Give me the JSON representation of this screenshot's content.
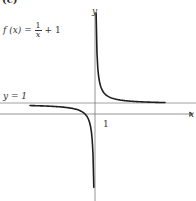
{
  "figure": {
    "panel_label": "(c)",
    "function_label": {
      "lhs": "f (x) =",
      "numerator": "1",
      "denominator": "x",
      "tail": "+ 1"
    },
    "asymptote_label": "y = 1",
    "axis_labels": {
      "x": "x",
      "y": "y"
    },
    "tick_labels": {
      "x_one": "1"
    },
    "colors": {
      "axis": "#7a7a7a",
      "curve": "#1e1e1e",
      "asymptote": "#8a8a8a",
      "text": "#333333"
    }
  },
  "chart_data": {
    "type": "line",
    "xlabel": "x",
    "ylabel": "y",
    "function": "1/x + 1",
    "asymptotes": {
      "horizontal": 1,
      "vertical": 0
    },
    "series": [
      {
        "name": "right branch (x>0)",
        "points": [
          [
            0.11,
            10.0
          ],
          [
            0.2,
            6.0
          ],
          [
            0.5,
            3.0
          ],
          [
            1,
            2.0
          ],
          [
            2,
            1.5
          ],
          [
            4,
            1.25
          ],
          [
            7,
            1.14
          ]
        ]
      },
      {
        "name": "left branch (x<0)",
        "points": [
          [
            -6.5,
            0.85
          ],
          [
            -4,
            0.75
          ],
          [
            -2,
            0.5
          ],
          [
            -1,
            0.0
          ],
          [
            -0.5,
            -1.0
          ],
          [
            -0.2,
            -4.0
          ],
          [
            -0.12,
            -7.3
          ]
        ]
      }
    ],
    "ticks": {
      "x": [
        1
      ]
    },
    "xlim": [
      -9.5,
      9.5
    ],
    "ylim": [
      -8.6,
      10.4
    ]
  }
}
